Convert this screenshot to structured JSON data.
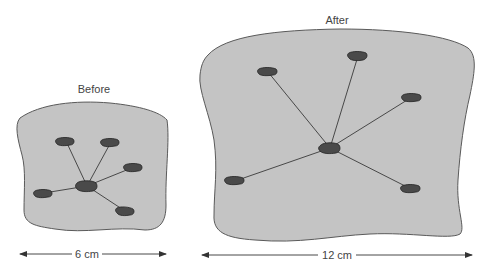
{
  "colors": {
    "blob_fill": "#c4c4c4",
    "blob_stroke": "#5a5a5a",
    "node_fill": "#4a4a4a",
    "node_stroke": "#222222",
    "edge": "#3a3a3a",
    "text": "#444444"
  },
  "panels": [
    {
      "id": "before",
      "title": "Before",
      "width_label": "6 cm",
      "nodes": [
        {
          "id": "center",
          "x": 87,
          "y": 186
        },
        {
          "id": "top-left",
          "x": 66,
          "y": 141
        },
        {
          "id": "top-right",
          "x": 111,
          "y": 142
        },
        {
          "id": "right",
          "x": 134,
          "y": 167
        },
        {
          "id": "left",
          "x": 44,
          "y": 193
        },
        {
          "id": "bottom-right",
          "x": 125,
          "y": 211
        }
      ]
    },
    {
      "id": "after",
      "title": "After",
      "width_label": "12 cm",
      "nodes": [
        {
          "id": "center",
          "x": 330,
          "y": 148
        },
        {
          "id": "top-left",
          "x": 268,
          "y": 72
        },
        {
          "id": "top",
          "x": 358,
          "y": 56
        },
        {
          "id": "right",
          "x": 412,
          "y": 97
        },
        {
          "id": "left",
          "x": 235,
          "y": 181
        },
        {
          "id": "bottom-right",
          "x": 411,
          "y": 189
        }
      ]
    }
  ]
}
